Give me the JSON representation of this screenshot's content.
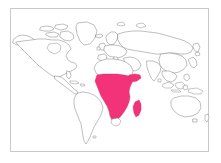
{
  "figure": {
    "type": "world-map",
    "projection": "equirectangular",
    "title": "",
    "frame_color": "#c9c9c9",
    "background_color": "#ffffff",
    "coastline_color": "#6f6f6f",
    "land_fill_color": "#ffffff",
    "width_px": 221,
    "height_px": 163
  },
  "highlight": {
    "color": "#f2337a",
    "stroke_color": "#d81f63",
    "label": "Sub-Saharan Africa",
    "regions": [
      "Sub-Saharan Africa",
      "Madagascar"
    ],
    "excluded": [
      "North Africa",
      "Southern tip of South Africa"
    ]
  },
  "continents": [
    {
      "name": "North America",
      "highlighted": false
    },
    {
      "name": "South America",
      "highlighted": false
    },
    {
      "name": "Europe",
      "highlighted": false
    },
    {
      "name": "Africa",
      "highlighted": true
    },
    {
      "name": "Asia",
      "highlighted": false
    },
    {
      "name": "Australia",
      "highlighted": false
    },
    {
      "name": "Greenland",
      "highlighted": false
    },
    {
      "name": "Madagascar",
      "highlighted": true
    }
  ],
  "legend": {
    "visible": false,
    "entries": []
  },
  "axes": {
    "visible": false,
    "x_ticks": [],
    "y_ticks": []
  }
}
